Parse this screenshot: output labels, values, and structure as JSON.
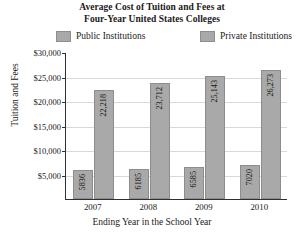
{
  "chart_data": {
    "type": "bar",
    "title": "Average Cost of Tuition and Fees at Four-Year United States Colleges",
    "title_lines": [
      "Average Cost of Tuition and Fees at",
      "Four-Year United States Colleges"
    ],
    "xlabel": "Ending Year in the School Year",
    "ylabel": "Tuition and Fees",
    "categories": [
      "2007",
      "2008",
      "2009",
      "2010"
    ],
    "series": [
      {
        "name": "Public Institutions",
        "color": "#a9a9a9",
        "values": [
          5836,
          6185,
          6585,
          7020
        ],
        "value_labels": [
          "5836",
          "6185",
          "6585",
          "7020"
        ]
      },
      {
        "name": "Private Institutions",
        "color": "#a9a9a9",
        "values": [
          22218,
          23712,
          25143,
          26273
        ],
        "value_labels": [
          "22,218",
          "23,712",
          "25,143",
          "26,273"
        ]
      }
    ],
    "ylim": [
      0,
      30000
    ],
    "ytick_values": [
      30000,
      25000,
      20000,
      15000,
      10000,
      5000
    ],
    "ytick_labels": [
      "$30,000",
      "$25,000",
      "$20,000",
      "$15,000",
      "$10,000",
      "$5,000"
    ],
    "grid": true,
    "legend_position": "top"
  },
  "legend": {
    "entries": [
      {
        "label": "Public Institutions",
        "color": "#a9a9a9"
      },
      {
        "label": "Private Institutions",
        "color": "#a9a9a9"
      }
    ]
  },
  "colors": {
    "bar_fill": "#a9a9a9",
    "bar_edge": "#8d8d8d",
    "axis": "#303030",
    "gridline": "#d9d9d9",
    "background": "#ffffff",
    "text": "#1a1a1a"
  }
}
